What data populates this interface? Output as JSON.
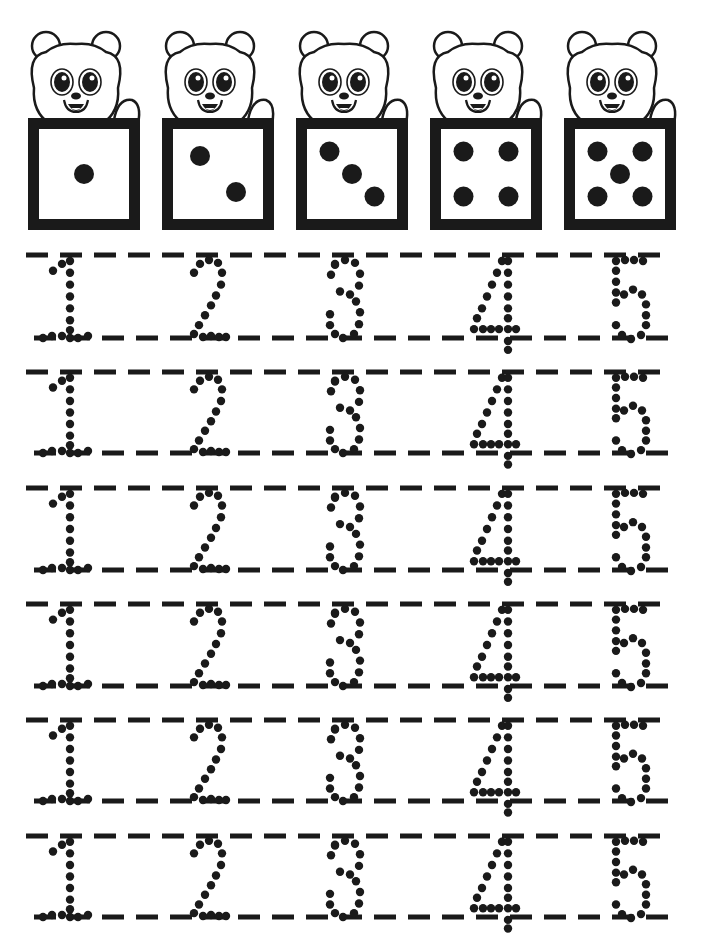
{
  "worksheet": {
    "title": "Number tracing 1-5 with dice",
    "ink_color": "#1a1a1a",
    "paper_color": "#ffffff",
    "header_cards": [
      {
        "number": 1,
        "pips": [
          [
            0.5,
            0.5
          ]
        ]
      },
      {
        "number": 2,
        "pips": [
          [
            0.3,
            0.3
          ],
          [
            0.7,
            0.7
          ]
        ]
      },
      {
        "number": 3,
        "pips": [
          [
            0.25,
            0.25
          ],
          [
            0.5,
            0.5
          ],
          [
            0.75,
            0.75
          ]
        ]
      },
      {
        "number": 4,
        "pips": [
          [
            0.25,
            0.25
          ],
          [
            0.75,
            0.25
          ],
          [
            0.25,
            0.75
          ],
          [
            0.75,
            0.75
          ]
        ]
      },
      {
        "number": 5,
        "pips": [
          [
            0.25,
            0.25
          ],
          [
            0.75,
            0.25
          ],
          [
            0.5,
            0.5
          ],
          [
            0.25,
            0.75
          ],
          [
            0.75,
            0.75
          ]
        ]
      }
    ],
    "card_x": [
      28,
      162,
      296,
      430,
      564
    ],
    "die_box": {
      "top": 118,
      "size": 112,
      "border": 11
    },
    "tracing_rows": [
      {
        "top": 255,
        "bottom": 338,
        "digits": [
          "1",
          "2",
          "3",
          "4",
          "5"
        ]
      },
      {
        "top": 372,
        "bottom": 453,
        "digits": [
          "1",
          "2",
          "3",
          "4",
          "5"
        ]
      },
      {
        "top": 488,
        "bottom": 570,
        "digits": [
          "1",
          "2",
          "3",
          "4",
          "5"
        ]
      },
      {
        "top": 604,
        "bottom": 686,
        "digits": [
          "1",
          "2",
          "3",
          "4",
          "5"
        ]
      },
      {
        "top": 720,
        "bottom": 801,
        "digits": [
          "1",
          "2",
          "3",
          "4",
          "5"
        ]
      },
      {
        "top": 836,
        "bottom": 917,
        "digits": [
          "1",
          "2",
          "3",
          "4",
          "5"
        ]
      }
    ],
    "digit_x": [
      70,
      205,
      345,
      490,
      628
    ],
    "digit_dots": {
      "1": [
        [
          -17,
          16
        ],
        [
          -8,
          9
        ],
        [
          0,
          6
        ],
        [
          0,
          18
        ],
        [
          0,
          30
        ],
        [
          0,
          42
        ],
        [
          0,
          54
        ],
        [
          0,
          66
        ],
        [
          0,
          76
        ],
        [
          -18,
          82
        ],
        [
          -8,
          82
        ],
        [
          0,
          84
        ],
        [
          8,
          84
        ],
        [
          18,
          82
        ],
        [
          -27,
          84
        ]
      ],
      "2": [
        [
          -11,
          18
        ],
        [
          -5,
          9
        ],
        [
          4,
          5
        ],
        [
          13,
          8
        ],
        [
          17,
          18
        ],
        [
          16,
          30
        ],
        [
          11,
          41
        ],
        [
          6,
          51
        ],
        [
          0,
          61
        ],
        [
          -6,
          71
        ],
        [
          -11,
          80
        ],
        [
          -2,
          83
        ],
        [
          6,
          82
        ],
        [
          14,
          83
        ],
        [
          21,
          83
        ]
      ],
      "3": [
        [
          -10,
          10
        ],
        [
          0,
          5
        ],
        [
          10,
          8
        ],
        [
          15,
          19
        ],
        [
          14,
          31
        ],
        [
          5,
          40
        ],
        [
          -5,
          37
        ],
        [
          11,
          47
        ],
        [
          15,
          58
        ],
        [
          14,
          70
        ],
        [
          9,
          80
        ],
        [
          -2,
          84
        ],
        [
          -10,
          80
        ],
        [
          -15,
          71
        ],
        [
          -15,
          60
        ],
        [
          -10,
          9
        ],
        [
          -14,
          20
        ]
      ],
      "4": [
        [
          12,
          6
        ],
        [
          7,
          18
        ],
        [
          2,
          30
        ],
        [
          -3,
          42
        ],
        [
          -8,
          54
        ],
        [
          -13,
          64
        ],
        [
          -16,
          75
        ],
        [
          -7,
          75
        ],
        [
          1,
          75
        ],
        [
          9,
          75
        ],
        [
          18,
          75
        ],
        [
          26,
          75
        ],
        [
          18,
          6
        ],
        [
          18,
          18
        ],
        [
          18,
          30
        ],
        [
          18,
          42
        ],
        [
          18,
          54
        ],
        [
          18,
          64
        ],
        [
          18,
          87
        ],
        [
          18,
          96
        ]
      ],
      "5": [
        [
          -12,
          6
        ],
        [
          -3,
          5
        ],
        [
          6,
          5
        ],
        [
          15,
          6
        ],
        [
          -12,
          16
        ],
        [
          -12,
          27
        ],
        [
          -12,
          38
        ],
        [
          -12,
          48
        ],
        [
          -4,
          40
        ],
        [
          5,
          35
        ],
        [
          14,
          40
        ],
        [
          18,
          50
        ],
        [
          18,
          61
        ],
        [
          18,
          71
        ],
        [
          13,
          81
        ],
        [
          3,
          85
        ],
        [
          -6,
          81
        ],
        [
          -12,
          71
        ]
      ]
    }
  }
}
